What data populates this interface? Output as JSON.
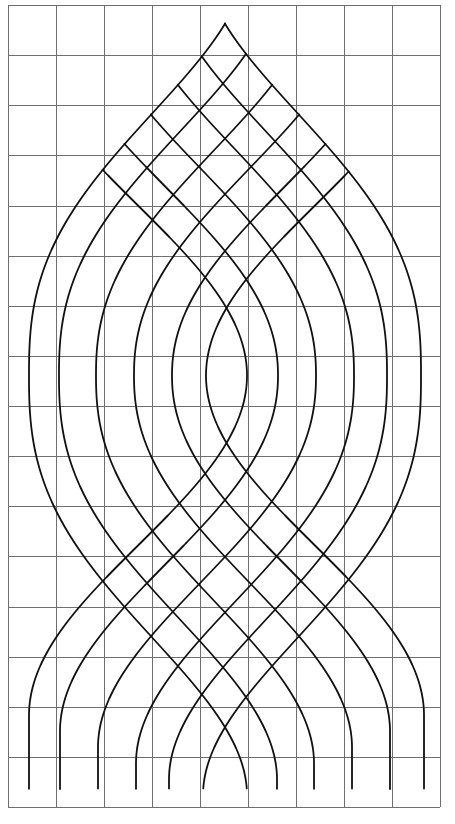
{
  "figure": {
    "title": "",
    "colors": {
      "background": "#ffffff",
      "grid": "#6f6f6f",
      "strand": "#111111"
    },
    "grid": {
      "left": 8,
      "top": 5,
      "cell_width": 48,
      "cell_height": 50.125,
      "columns": 9,
      "rows": 16
    },
    "strands": {
      "center_x": 225,
      "center_y": 375.5,
      "bottom_y": 789,
      "shift_amplitude": 218,
      "left_family_mid_x": [
        29,
        59,
        96,
        134,
        172,
        206
      ],
      "right_family_mid_x": [
        421,
        387,
        354,
        316,
        278,
        247
      ],
      "profile_span": [
        420,
        404,
        388,
        372,
        356,
        340
      ],
      "profile_power": [
        1.3,
        1.24,
        1.18,
        1.12,
        1.06,
        1.0
      ],
      "count": 12
    }
  }
}
